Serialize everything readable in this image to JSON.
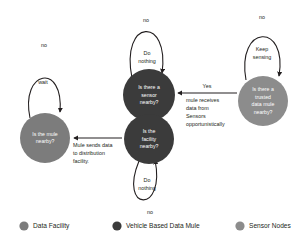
{
  "diagram": {
    "nodes": [
      {
        "id": "facility",
        "role": "Data Facility",
        "color": "#7c7c7c",
        "lines": [
          "Is the mule",
          "nearby?"
        ]
      },
      {
        "id": "sensor-query",
        "role": "Vehicle Based Data Mule",
        "color": "#3b3b3b",
        "lines": [
          "Is there a",
          "sensor",
          "nearby?"
        ]
      },
      {
        "id": "facility-query",
        "role": "Vehicle Based Data Mule",
        "color": "#3b3b3b",
        "lines": [
          "Is the",
          "facility",
          "nearby?"
        ]
      },
      {
        "id": "trusted-mule-query",
        "role": "Sensor Nodes",
        "color": "#8c8c8c",
        "lines": [
          "Is there a",
          "trusted",
          "data mule",
          "nearby?"
        ]
      }
    ],
    "edges": [
      {
        "id": "facility-self-no",
        "label": "no"
      },
      {
        "id": "facility-self-wait",
        "label": "wait"
      },
      {
        "id": "sensor-self-no",
        "label": "no"
      },
      {
        "id": "sensor-self-do-nothing-1",
        "label": "Do"
      },
      {
        "id": "sensor-self-do-nothing-2",
        "label": "nothing"
      },
      {
        "id": "facility-query-self-do-nothing-1",
        "label": "Do"
      },
      {
        "id": "facility-query-self-do-nothing-2",
        "label": "nothing"
      },
      {
        "id": "facility-query-self-no",
        "label": "no"
      },
      {
        "id": "trusted-self-no",
        "label": "no"
      },
      {
        "id": "trusted-self-keep-1",
        "label": "Keep"
      },
      {
        "id": "trusted-self-keep-2",
        "label": "sensing"
      },
      {
        "id": "yes-transfer-label",
        "label": "Yes"
      },
      {
        "id": "mule-receives-1",
        "label": "mule receives"
      },
      {
        "id": "mule-receives-2",
        "label": "data from"
      },
      {
        "id": "mule-receives-3",
        "label": "Sensors"
      },
      {
        "id": "mule-receives-4",
        "label": "opportunistically"
      },
      {
        "id": "mule-sends-1",
        "label": "Mule sends data"
      },
      {
        "id": "mule-sends-2",
        "label": "to distribution"
      },
      {
        "id": "mule-sends-3",
        "label": "facility."
      }
    ]
  },
  "legend": {
    "items": [
      {
        "label": "Data Facility",
        "color": "#7c7c7c"
      },
      {
        "label": "Vehicle Based Data Mule",
        "color": "#3b3b3b"
      },
      {
        "label": "Sensor Nodes",
        "color": "#8c8c8c"
      }
    ]
  }
}
